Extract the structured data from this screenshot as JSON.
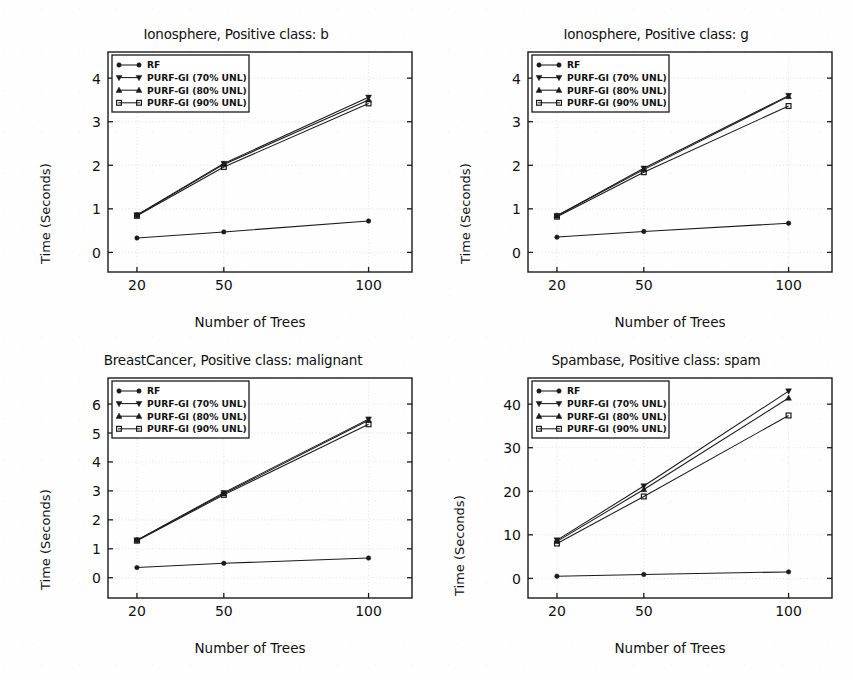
{
  "figure": {
    "background_color": "#fefefe",
    "line_color": "#1a1a1a",
    "grid_color": "#d9d9d9",
    "panel_count": 4
  },
  "common": {
    "xlabel": "Number of Trees",
    "ylabel": "Time (Seconds)",
    "xticks": [
      "20",
      "50",
      "100"
    ],
    "series_names": [
      "RF",
      "PURF-GI (70% UNL)",
      "PURF-GI (80% UNL)",
      "PURF-GI (90% UNL)"
    ],
    "markers": [
      "circle",
      "triangle-down",
      "triangle-up",
      "square"
    ]
  },
  "chart_data": [
    {
      "type": "line",
      "title": "Ionosphere, Positive class: b",
      "xlabel": "Number of Trees",
      "ylabel": "Time (Seconds)",
      "x": [
        20,
        50,
        100
      ],
      "xticklabels": [
        "20",
        "50",
        "100"
      ],
      "xlim": [
        10,
        115
      ],
      "ylim": [
        -0.45,
        4.6
      ],
      "yticks": [
        0,
        1,
        2,
        3,
        4
      ],
      "yticklabels": [
        "0",
        "1",
        "2",
        "3",
        "4"
      ],
      "grid": true,
      "legend_position": "upper-left",
      "series": [
        {
          "name": "RF",
          "marker": "circle",
          "values": [
            0.33,
            0.47,
            0.72
          ]
        },
        {
          "name": "PURF-GI (70% UNL)",
          "marker": "triangle-down",
          "values": [
            0.86,
            2.04,
            3.56
          ]
        },
        {
          "name": "PURF-GI (80% UNL)",
          "marker": "triangle-up",
          "values": [
            0.85,
            2.02,
            3.5
          ]
        },
        {
          "name": "PURF-GI (90% UNL)",
          "marker": "square",
          "values": [
            0.84,
            1.96,
            3.42
          ]
        }
      ]
    },
    {
      "type": "line",
      "title": "Ionosphere, Positive class: g",
      "xlabel": "Number of Trees",
      "ylabel": "Time (Seconds)",
      "x": [
        20,
        50,
        100
      ],
      "xticklabels": [
        "20",
        "50",
        "100"
      ],
      "xlim": [
        10,
        115
      ],
      "ylim": [
        -0.45,
        4.6
      ],
      "yticks": [
        0,
        1,
        2,
        3,
        4
      ],
      "yticklabels": [
        "0",
        "1",
        "2",
        "3",
        "4"
      ],
      "grid": true,
      "legend_position": "upper-left",
      "series": [
        {
          "name": "RF",
          "marker": "circle",
          "values": [
            0.35,
            0.48,
            0.67
          ]
        },
        {
          "name": "PURF-GI (70% UNL)",
          "marker": "triangle-down",
          "values": [
            0.84,
            1.93,
            3.6
          ]
        },
        {
          "name": "PURF-GI (80% UNL)",
          "marker": "triangle-up",
          "values": [
            0.84,
            1.9,
            3.58
          ]
        },
        {
          "name": "PURF-GI (90% UNL)",
          "marker": "square",
          "values": [
            0.82,
            1.84,
            3.36
          ]
        }
      ]
    },
    {
      "type": "line",
      "title": "BreastCancer, Positive class: malignant",
      "xlabel": "Number of Trees",
      "ylabel": "Time (Seconds)",
      "x": [
        20,
        50,
        100
      ],
      "xticklabels": [
        "20",
        "50",
        "100"
      ],
      "xlim": [
        10,
        115
      ],
      "ylim": [
        -0.7,
        6.9
      ],
      "yticks": [
        0,
        1,
        2,
        3,
        4,
        5,
        6
      ],
      "yticklabels": [
        "0",
        "1",
        "2",
        "3",
        "4",
        "5",
        "6"
      ],
      "grid": true,
      "legend_position": "upper-left",
      "series": [
        {
          "name": "RF",
          "marker": "circle",
          "values": [
            0.35,
            0.5,
            0.68
          ]
        },
        {
          "name": "PURF-GI (70% UNL)",
          "marker": "triangle-down",
          "values": [
            1.3,
            2.94,
            5.48
          ]
        },
        {
          "name": "PURF-GI (80% UNL)",
          "marker": "triangle-up",
          "values": [
            1.3,
            2.9,
            5.44
          ]
        },
        {
          "name": "PURF-GI (90% UNL)",
          "marker": "square",
          "values": [
            1.28,
            2.86,
            5.3
          ]
        }
      ]
    },
    {
      "type": "line",
      "title": "Spambase, Positive class: spam",
      "xlabel": "Number of Trees",
      "ylabel": "Time (Seconds)",
      "x": [
        20,
        50,
        100
      ],
      "xticklabels": [
        "20",
        "50",
        "100"
      ],
      "xlim": [
        10,
        115
      ],
      "ylim": [
        -4.5,
        46
      ],
      "yticks": [
        0,
        10,
        20,
        30,
        40
      ],
      "yticklabels": [
        "0",
        "10",
        "20",
        "30",
        "40"
      ],
      "grid": true,
      "legend_position": "upper-left",
      "series": [
        {
          "name": "RF",
          "marker": "circle",
          "values": [
            0.5,
            0.9,
            1.5
          ]
        },
        {
          "name": "PURF-GI (70% UNL)",
          "marker": "triangle-down",
          "values": [
            8.8,
            21.2,
            43.0
          ]
        },
        {
          "name": "PURF-GI (80% UNL)",
          "marker": "triangle-up",
          "values": [
            8.5,
            20.4,
            41.4
          ]
        },
        {
          "name": "PURF-GI (90% UNL)",
          "marker": "square",
          "values": [
            8.0,
            18.8,
            37.4
          ]
        }
      ]
    }
  ],
  "panels": [
    {
      "title": "Ionosphere, Positive class: b"
    },
    {
      "title": "Ionosphere, Positive class: g"
    },
    {
      "title": "BreastCancer, Positive class: malignant"
    },
    {
      "title": "Spambase, Positive class: spam"
    }
  ]
}
